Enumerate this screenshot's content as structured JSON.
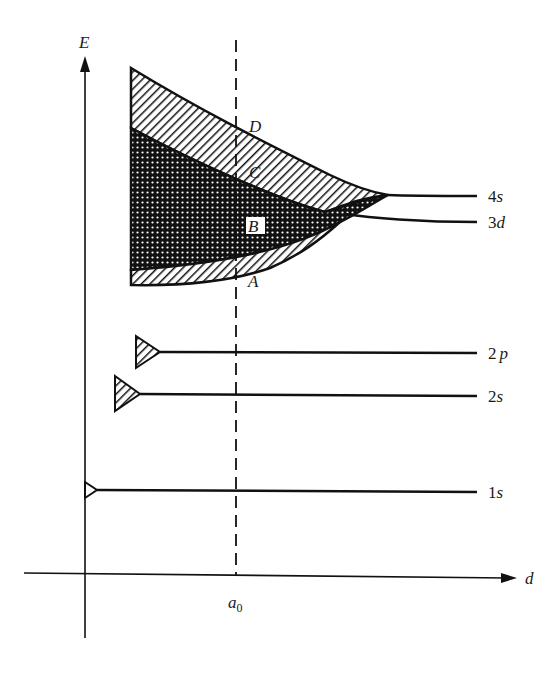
{
  "diagram": {
    "type": "energy-level-vs-interatomic-distance",
    "axes": {
      "y_label": "E",
      "x_label": "d",
      "x_marker": {
        "label": "a",
        "subscript": "0"
      }
    },
    "levels": [
      {
        "name": "1s",
        "num": "1",
        "orb": "s",
        "band": "narrow"
      },
      {
        "name": "2s",
        "num": "2",
        "orb": "s",
        "band": "hatched"
      },
      {
        "name": "2p",
        "num": "2",
        "orb": "p",
        "band": "hatched"
      },
      {
        "name": "3d",
        "num": "3",
        "orb": "d",
        "band": "dotted"
      },
      {
        "name": "4s",
        "num": "4",
        "orb": "s",
        "band": "hatched"
      }
    ],
    "points": [
      "A",
      "B",
      "C",
      "D"
    ],
    "colors": {
      "ink": "#111111",
      "background": "#ffffff"
    }
  }
}
